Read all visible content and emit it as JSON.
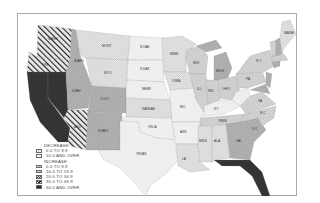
{
  "map": {
    "type": "choropleth",
    "region": "United States (contiguous)",
    "states": [
      {
        "abbr": "WASH",
        "category": "inc_35_49"
      },
      {
        "abbr": "ORE",
        "category": "inc_35_49"
      },
      {
        "abbr": "CALIF",
        "category": "inc_50_over"
      },
      {
        "abbr": "IDAHO",
        "category": "inc_20_34"
      },
      {
        "abbr": "NEV",
        "category": "inc_50_over"
      },
      {
        "abbr": "MONT",
        "category": "inc_0_9"
      },
      {
        "abbr": "WYO",
        "category": "inc_0_9"
      },
      {
        "abbr": "UTAH",
        "category": "inc_20_34"
      },
      {
        "abbr": "COLO",
        "category": "inc_20_34"
      },
      {
        "abbr": "ARIZ",
        "category": "inc_35_49"
      },
      {
        "abbr": "N MEX",
        "category": "inc_20_34"
      },
      {
        "abbr": "N DAK",
        "category": "dec_0_9"
      },
      {
        "abbr": "S DAK",
        "category": "dec_0_9"
      },
      {
        "abbr": "NEBR",
        "category": "dec_0_9"
      },
      {
        "abbr": "KANSAS",
        "category": "inc_0_9"
      },
      {
        "abbr": "OKLA",
        "category": "dec_0_9"
      },
      {
        "abbr": "TEXAS",
        "category": "dec_0_9"
      },
      {
        "abbr": "MINN",
        "category": "inc_0_9"
      },
      {
        "abbr": "IOWA",
        "category": "inc_0_9"
      },
      {
        "abbr": "MO",
        "category": "dec_0_9"
      },
      {
        "abbr": "ARK",
        "category": "dec_0_9"
      },
      {
        "abbr": "LA",
        "category": "inc_0_9"
      },
      {
        "abbr": "WIS",
        "category": "inc_10_19"
      },
      {
        "abbr": "ILL",
        "category": "inc_10_19"
      },
      {
        "abbr": "MICH",
        "category": "inc_20_34"
      },
      {
        "abbr": "IND",
        "category": "inc_10_19"
      },
      {
        "abbr": "OHIO",
        "category": "inc_10_19"
      },
      {
        "abbr": "KY",
        "category": "dec_0_9"
      },
      {
        "abbr": "TENN",
        "category": "inc_10_19"
      },
      {
        "abbr": "MISS",
        "category": "inc_0_9"
      },
      {
        "abbr": "ALA",
        "category": "inc_0_9"
      },
      {
        "abbr": "GA",
        "category": "inc_20_34"
      },
      {
        "abbr": "FLA",
        "category": "inc_50_over"
      },
      {
        "abbr": "S C",
        "category": "inc_20_34"
      },
      {
        "abbr": "N C",
        "category": "inc_10_19"
      },
      {
        "abbr": "VA",
        "category": "inc_10_19"
      },
      {
        "abbr": "W VA",
        "category": "dec_0_9"
      },
      {
        "abbr": "PA",
        "category": "inc_10_19"
      },
      {
        "abbr": "N Y",
        "category": "inc_10_19"
      },
      {
        "abbr": "MAINE",
        "category": "inc_0_9"
      },
      {
        "abbr": "VT",
        "category": "inc_10_19"
      },
      {
        "abbr": "N H",
        "category": "inc_20_34"
      },
      {
        "abbr": "MASS",
        "category": "inc_10_19"
      },
      {
        "abbr": "CONN",
        "category": "inc_20_34"
      },
      {
        "abbr": "N J",
        "category": "inc_20_34"
      },
      {
        "abbr": "MD",
        "category": "inc_20_34"
      },
      {
        "abbr": "DEL",
        "category": "inc_20_34"
      }
    ]
  },
  "legend": {
    "decrease_heading": "DECREASE",
    "increase_heading": "INCREASE",
    "decrease": [
      {
        "key": "dec_0_9",
        "label": "0.0 TO 9.9"
      },
      {
        "key": "dec_10_over",
        "label": "10.0 AND OVER"
      }
    ],
    "increase": [
      {
        "key": "inc_0_9",
        "label": "0.0 TO 9.9"
      },
      {
        "key": "inc_10_19",
        "label": "10.0 TO 19.9"
      },
      {
        "key": "inc_20_34",
        "label": "20.0 TO 34.9"
      },
      {
        "key": "inc_35_49",
        "label": "35.0 TO 49.9"
      },
      {
        "key": "inc_50_over",
        "label": "50.0 AND OVER"
      }
    ]
  },
  "labels": {
    "mont": "MONT",
    "n_dak": "N DAK",
    "s_dak": "S DAK",
    "wyo": "WYO",
    "nebr": "NEBR",
    "minn": "MINN",
    "iowa": "IOWA",
    "kansas": "KANSAS",
    "okla": "OKLA",
    "texas": "TEXAS",
    "mo": "MO",
    "ark": "ARK",
    "la": "LA",
    "miss": "MISS",
    "ala": "ALA",
    "wis": "WIS",
    "ill": "ILL",
    "mich": "MICH",
    "ind": "IND",
    "ohio": "OHIO",
    "ky": "KY",
    "tenn": "TENN",
    "ga": "GA",
    "fla": "FLA",
    "sc": "S C",
    "nc": "N C",
    "va": "VA",
    "pa": "PA",
    "ny": "N Y",
    "maine": "MAINE",
    "idaho": "IDAHO",
    "utah": "UTAH",
    "colo": "COLO",
    "n_mex": "N MEX",
    "ariz": "ARIZ",
    "nev": "NEV",
    "calif": "CALIF",
    "ore": "ORE",
    "wash": "WASH"
  }
}
